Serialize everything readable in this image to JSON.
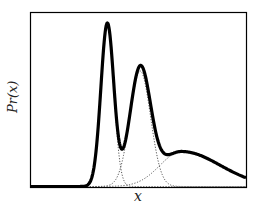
{
  "chart_data": {
    "type": "line",
    "title": "",
    "xlabel": "x",
    "ylabel": "Pr(x)",
    "xlim": [
      0,
      1
    ],
    "ylim": [
      0,
      1
    ],
    "grid": false,
    "ticks": false,
    "legend": null,
    "components": [
      {
        "name": "component-1",
        "style": "dotted",
        "center": 0.355,
        "sigma": 0.03,
        "amplitude": 0.93
      },
      {
        "name": "component-2",
        "style": "dotted",
        "center": 0.508,
        "sigma": 0.048,
        "amplitude": 0.66
      },
      {
        "name": "component-3",
        "style": "dotted",
        "center": 0.7,
        "sigma": 0.1,
        "amplitude": 0.2,
        "skew": 1.8
      }
    ],
    "series": [
      {
        "name": "mixture (sum)",
        "style": "solid-thick",
        "description": "sum of three components"
      }
    ],
    "annotations": []
  },
  "labels": {
    "x": "x",
    "y": "Pr(x)"
  },
  "colors": {
    "curve": "#000000",
    "components": "#555555",
    "frame": "#000000"
  }
}
